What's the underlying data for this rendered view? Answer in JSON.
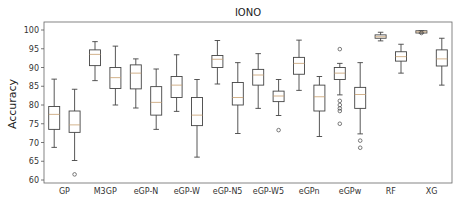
{
  "chart_data": {
    "type": "box",
    "title": "IONO",
    "xlabel": "",
    "ylabel": "Accuracy",
    "ylim": [
      60,
      101
    ],
    "yticks": [
      60,
      65,
      70,
      75,
      80,
      85,
      90,
      95,
      100
    ],
    "grid": false,
    "legend": null,
    "categories": [
      "GP",
      "M3GP",
      "eGP-N",
      "eGP-W",
      "eGP-N5",
      "eGP-W5",
      "eGPn",
      "eGPw",
      "RF",
      "XG"
    ],
    "boxes_per_category": 2,
    "series": [
      {
        "category": "GP",
        "index": 0,
        "whisker_low": 68.7,
        "q1": 73.5,
        "median": 77.5,
        "q3": 79.6,
        "whisker_high": 86.9,
        "outliers": []
      },
      {
        "category": "GP",
        "index": 1,
        "whisker_low": 65.2,
        "q1": 72.7,
        "median": 74.7,
        "q3": 78.4,
        "whisker_high": 84.2,
        "outliers": [
          61.5
        ]
      },
      {
        "category": "M3GP",
        "index": 0,
        "whisker_low": 86.5,
        "q1": 90.5,
        "median": 93.5,
        "q3": 94.7,
        "whisker_high": 96.9,
        "outliers": []
      },
      {
        "category": "M3GP",
        "index": 1,
        "whisker_low": 80.0,
        "q1": 84.4,
        "median": 87.3,
        "q3": 90.0,
        "whisker_high": 95.7,
        "outliers": []
      },
      {
        "category": "eGP-N",
        "index": 0,
        "whisker_low": 79.2,
        "q1": 84.3,
        "median": 88.5,
        "q3": 90.7,
        "whisker_high": 92.3,
        "outliers": []
      },
      {
        "category": "eGP-N",
        "index": 1,
        "whisker_low": 73.5,
        "q1": 77.3,
        "median": 80.7,
        "q3": 84.9,
        "whisker_high": 89.6,
        "outliers": []
      },
      {
        "category": "eGP-W",
        "index": 0,
        "whisker_low": 78.3,
        "q1": 82.0,
        "median": 85.3,
        "q3": 87.6,
        "whisker_high": 93.4,
        "outliers": []
      },
      {
        "category": "eGP-W",
        "index": 1,
        "whisker_low": 66.1,
        "q1": 74.5,
        "median": 77.3,
        "q3": 82.0,
        "whisker_high": 86.8,
        "outliers": []
      },
      {
        "category": "eGP-N5",
        "index": 0,
        "whisker_low": 85.6,
        "q1": 90.0,
        "median": 92.2,
        "q3": 93.2,
        "whisker_high": 97.2,
        "outliers": []
      },
      {
        "category": "eGP-N5",
        "index": 1,
        "whisker_low": 72.4,
        "q1": 80.0,
        "median": 82.0,
        "q3": 86.0,
        "whisker_high": 91.3,
        "outliers": []
      },
      {
        "category": "eGP-W5",
        "index": 0,
        "whisker_low": 79.1,
        "q1": 85.3,
        "median": 88.0,
        "q3": 89.5,
        "whisker_high": 93.7,
        "outliers": []
      },
      {
        "category": "eGP-W5",
        "index": 1,
        "whisker_low": 77.2,
        "q1": 80.9,
        "median": 82.4,
        "q3": 83.7,
        "whisker_high": 86.8,
        "outliers": [
          73.3
        ]
      },
      {
        "category": "eGPn",
        "index": 0,
        "whisker_low": 83.9,
        "q1": 88.2,
        "median": 91.1,
        "q3": 92.7,
        "whisker_high": 97.3,
        "outliers": []
      },
      {
        "category": "eGPn",
        "index": 1,
        "whisker_low": 71.6,
        "q1": 78.4,
        "median": 82.2,
        "q3": 85.3,
        "whisker_high": 87.6,
        "outliers": []
      },
      {
        "category": "eGPw",
        "index": 0,
        "whisker_low": 82.7,
        "q1": 86.8,
        "median": 88.5,
        "q3": 90.0,
        "whisker_high": 91.1,
        "outliers": [
          94.9,
          81.1,
          80.0,
          79.1,
          78.4,
          75.0
        ]
      },
      {
        "category": "eGPw",
        "index": 1,
        "whisker_low": 72.3,
        "q1": 79.1,
        "median": 82.8,
        "q3": 84.7,
        "whisker_high": 91.3,
        "outliers": [
          70.5,
          68.6
        ]
      },
      {
        "category": "RF",
        "index": 0,
        "whisker_low": 97.1,
        "q1": 97.8,
        "median": 98.2,
        "q3": 98.7,
        "whisker_high": 99.4,
        "outliers": []
      },
      {
        "category": "RF",
        "index": 1,
        "whisker_low": 88.5,
        "q1": 91.7,
        "median": 92.9,
        "q3": 94.2,
        "whisker_high": 96.2,
        "outliers": []
      },
      {
        "category": "XG",
        "index": 0,
        "whisker_low": 99.2,
        "q1": 99.2,
        "median": 99.5,
        "q3": 99.8,
        "whisker_high": 99.8,
        "outliers": [
          99.2
        ]
      },
      {
        "category": "XG",
        "index": 1,
        "whisker_low": 85.3,
        "q1": 90.4,
        "median": 92.3,
        "q3": 94.7,
        "whisker_high": 97.8,
        "outliers": []
      }
    ]
  },
  "colors": {
    "box": "#444444",
    "median": "#c8a070",
    "axis": "#555555",
    "text": "#333333"
  }
}
